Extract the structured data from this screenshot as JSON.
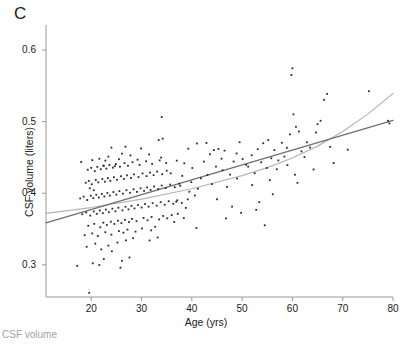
{
  "figure": {
    "panel_label": "C",
    "caption_sliver": "CSF volume"
  },
  "chart_data": {
    "type": "scatter",
    "title": "",
    "xlabel": "Age (yrs)",
    "ylabel": "CSF volume (liters)",
    "xlim": [
      11,
      80
    ],
    "ylim": [
      0.255,
      0.635
    ],
    "xticks": [
      20,
      30,
      40,
      50,
      60,
      70,
      80
    ],
    "xticklabels": [
      "20",
      "30",
      "40",
      "50",
      "60",
      "70",
      "80"
    ],
    "yticks": [
      0.3,
      0.4,
      0.5,
      0.6
    ],
    "yticklabels": [
      "0.3",
      "0.4",
      "0.5",
      "0.6"
    ],
    "grid": false,
    "legend": "none",
    "marker": {
      "shape": "square",
      "size_px": 1.8,
      "color": "#2b2b2b"
    },
    "series": [
      {
        "name": "CSF volume vs age",
        "points": [
          [
            17.2,
            0.2985
          ],
          [
            19.6,
            0.2608
          ],
          [
            20.3,
            0.3021
          ],
          [
            21.6,
            0.2997
          ],
          [
            22.5,
            0.3082
          ],
          [
            25.8,
            0.2959
          ],
          [
            26.1,
            0.3055
          ],
          [
            27.6,
            0.3102
          ],
          [
            24.1,
            0.3188
          ],
          [
            22.0,
            0.3215
          ],
          [
            19.1,
            0.3252
          ],
          [
            20.8,
            0.3295
          ],
          [
            23.4,
            0.3268
          ],
          [
            25.2,
            0.331
          ],
          [
            26.9,
            0.3341
          ],
          [
            28.3,
            0.3372
          ],
          [
            31.6,
            0.334
          ],
          [
            33.2,
            0.3382
          ],
          [
            18.7,
            0.3414
          ],
          [
            20.2,
            0.3438
          ],
          [
            21.3,
            0.3402
          ],
          [
            22.8,
            0.3455
          ],
          [
            24.0,
            0.3421
          ],
          [
            25.5,
            0.347
          ],
          [
            26.4,
            0.3449
          ],
          [
            27.2,
            0.3492
          ],
          [
            28.8,
            0.3463
          ],
          [
            30.1,
            0.3508
          ],
          [
            31.9,
            0.3481
          ],
          [
            32.7,
            0.3531
          ],
          [
            19.4,
            0.3545
          ],
          [
            20.6,
            0.3572
          ],
          [
            21.8,
            0.3524
          ],
          [
            22.4,
            0.3588
          ],
          [
            23.1,
            0.3556
          ],
          [
            23.9,
            0.3602
          ],
          [
            24.6,
            0.3571
          ],
          [
            25.3,
            0.3615
          ],
          [
            26.0,
            0.3583
          ],
          [
            26.7,
            0.3628
          ],
          [
            27.5,
            0.3598
          ],
          [
            28.1,
            0.3641
          ],
          [
            29.0,
            0.361
          ],
          [
            30.4,
            0.3655
          ],
          [
            31.2,
            0.3622
          ],
          [
            32.0,
            0.3668
          ],
          [
            33.5,
            0.3634
          ],
          [
            34.3,
            0.3682
          ],
          [
            35.1,
            0.3649
          ],
          [
            36.0,
            0.3695
          ],
          [
            18.2,
            0.3706
          ],
          [
            19.0,
            0.3732
          ],
          [
            19.8,
            0.3688
          ],
          [
            20.5,
            0.3745
          ],
          [
            21.1,
            0.3712
          ],
          [
            21.7,
            0.3758
          ],
          [
            22.3,
            0.3721
          ],
          [
            22.9,
            0.3771
          ],
          [
            23.5,
            0.3735
          ],
          [
            24.2,
            0.3784
          ],
          [
            24.8,
            0.3748
          ],
          [
            25.4,
            0.3797
          ],
          [
            26.2,
            0.3761
          ],
          [
            26.8,
            0.381
          ],
          [
            27.4,
            0.3774
          ],
          [
            28.0,
            0.3823
          ],
          [
            28.6,
            0.3787
          ],
          [
            29.3,
            0.3836
          ],
          [
            30.0,
            0.38
          ],
          [
            30.7,
            0.3849
          ],
          [
            31.4,
            0.3813
          ],
          [
            32.2,
            0.3862
          ],
          [
            33.0,
            0.3826
          ],
          [
            33.8,
            0.3875
          ],
          [
            34.6,
            0.3839
          ],
          [
            35.4,
            0.3888
          ],
          [
            36.3,
            0.3852
          ],
          [
            37.1,
            0.3901
          ],
          [
            38.0,
            0.3865
          ],
          [
            39.2,
            0.3914
          ],
          [
            17.8,
            0.3927
          ],
          [
            18.5,
            0.3952
          ],
          [
            19.2,
            0.3905
          ],
          [
            19.9,
            0.3965
          ],
          [
            20.4,
            0.3932
          ],
          [
            21.0,
            0.3978
          ],
          [
            21.5,
            0.3941
          ],
          [
            22.1,
            0.399
          ],
          [
            22.6,
            0.3954
          ],
          [
            23.2,
            0.4003
          ],
          [
            23.7,
            0.3967
          ],
          [
            24.4,
            0.4016
          ],
          [
            25.0,
            0.398
          ],
          [
            25.6,
            0.4029
          ],
          [
            26.3,
            0.3993
          ],
          [
            27.0,
            0.4042
          ],
          [
            27.7,
            0.4006
          ],
          [
            28.4,
            0.4055
          ],
          [
            29.1,
            0.4019
          ],
          [
            29.8,
            0.4068
          ],
          [
            30.5,
            0.4032
          ],
          [
            31.1,
            0.4081
          ],
          [
            31.8,
            0.4045
          ],
          [
            32.5,
            0.4094
          ],
          [
            33.3,
            0.4058
          ],
          [
            34.0,
            0.4107
          ],
          [
            34.8,
            0.4071
          ],
          [
            35.7,
            0.412
          ],
          [
            36.6,
            0.4084
          ],
          [
            37.5,
            0.4133
          ],
          [
            18.9,
            0.4146
          ],
          [
            19.5,
            0.4172
          ],
          [
            20.1,
            0.4125
          ],
          [
            20.9,
            0.4185
          ],
          [
            21.4,
            0.4152
          ],
          [
            22.2,
            0.4198
          ],
          [
            22.7,
            0.4161
          ],
          [
            23.3,
            0.4211
          ],
          [
            23.8,
            0.4174
          ],
          [
            24.5,
            0.4224
          ],
          [
            25.1,
            0.4187
          ],
          [
            25.9,
            0.4237
          ],
          [
            26.5,
            0.42
          ],
          [
            27.1,
            0.425
          ],
          [
            27.9,
            0.4213
          ],
          [
            28.5,
            0.4263
          ],
          [
            29.4,
            0.4226
          ],
          [
            30.2,
            0.4276
          ],
          [
            31.0,
            0.4239
          ],
          [
            31.7,
            0.4289
          ],
          [
            32.4,
            0.4252
          ],
          [
            33.1,
            0.4302
          ],
          [
            34.1,
            0.4265
          ],
          [
            35.0,
            0.4315
          ],
          [
            35.8,
            0.4278
          ],
          [
            19.3,
            0.4328
          ],
          [
            20.0,
            0.4355
          ],
          [
            20.7,
            0.4308
          ],
          [
            21.2,
            0.4368
          ],
          [
            21.9,
            0.4335
          ],
          [
            22.5,
            0.4381
          ],
          [
            23.0,
            0.4344
          ],
          [
            23.6,
            0.4394
          ],
          [
            24.3,
            0.4357
          ],
          [
            24.9,
            0.4407
          ],
          [
            25.7,
            0.437
          ],
          [
            26.6,
            0.442
          ],
          [
            27.3,
            0.4383
          ],
          [
            28.2,
            0.4433
          ],
          [
            29.6,
            0.4396
          ],
          [
            30.9,
            0.4446
          ],
          [
            32.1,
            0.4409
          ],
          [
            33.6,
            0.4459
          ],
          [
            34.9,
            0.4422
          ],
          [
            18.0,
            0.4435
          ],
          [
            21.6,
            0.4482
          ],
          [
            23.4,
            0.4512
          ],
          [
            25.5,
            0.4475
          ],
          [
            27.8,
            0.4528
          ],
          [
            29.2,
            0.4468
          ],
          [
            31.5,
            0.4541
          ],
          [
            33.9,
            0.4498
          ],
          [
            20.2,
            0.4462
          ],
          [
            22.8,
            0.4455
          ],
          [
            26.1,
            0.4553
          ],
          [
            24.0,
            0.4637
          ],
          [
            26.8,
            0.465
          ],
          [
            29.9,
            0.4625
          ],
          [
            33.4,
            0.4742
          ],
          [
            34.2,
            0.4762
          ],
          [
            34.0,
            0.5065
          ],
          [
            22.4,
            0.4386
          ],
          [
            24.7,
            0.4378
          ],
          [
            20.5,
            0.4042
          ],
          [
            19.7,
            0.4069
          ],
          [
            36.5,
            0.3598
          ],
          [
            37.2,
            0.3712
          ],
          [
            38.4,
            0.3652
          ],
          [
            36.9,
            0.3881
          ],
          [
            38.8,
            0.3795
          ],
          [
            37.7,
            0.4104
          ],
          [
            39.5,
            0.4021
          ],
          [
            38.1,
            0.4242
          ],
          [
            39.9,
            0.4155
          ],
          [
            37.0,
            0.4455
          ],
          [
            38.5,
            0.4418
          ],
          [
            39.3,
            0.4622
          ],
          [
            40.6,
            0.3968
          ],
          [
            41.2,
            0.4063
          ],
          [
            41.8,
            0.4208
          ],
          [
            40.1,
            0.4352
          ],
          [
            42.4,
            0.4442
          ],
          [
            41.0,
            0.4695
          ],
          [
            42.9,
            0.4702
          ],
          [
            43.6,
            0.4545
          ],
          [
            40.9,
            0.3515
          ],
          [
            43.1,
            0.4255
          ],
          [
            44.0,
            0.4128
          ],
          [
            44.8,
            0.4372
          ],
          [
            45.3,
            0.4618
          ],
          [
            45.9,
            0.4482
          ],
          [
            46.5,
            0.4595
          ],
          [
            44.4,
            0.4602
          ],
          [
            46.1,
            0.4321
          ],
          [
            47.0,
            0.4088
          ],
          [
            45.0,
            0.3915
          ],
          [
            46.8,
            0.3648
          ],
          [
            47.6,
            0.426
          ],
          [
            48.3,
            0.4442
          ],
          [
            48.9,
            0.4555
          ],
          [
            49.5,
            0.4712
          ],
          [
            50.1,
            0.4478
          ],
          [
            49.0,
            0.4205
          ],
          [
            50.8,
            0.4398
          ],
          [
            51.2,
            0.4372
          ],
          [
            48.0,
            0.3812
          ],
          [
            49.8,
            0.3725
          ],
          [
            51.9,
            0.453
          ],
          [
            52.5,
            0.4278
          ],
          [
            53.1,
            0.4615
          ],
          [
            53.8,
            0.4432
          ],
          [
            54.2,
            0.4698
          ],
          [
            52.0,
            0.4115
          ],
          [
            54.9,
            0.4352
          ],
          [
            53.4,
            0.3875
          ],
          [
            52.8,
            0.3768
          ],
          [
            54.5,
            0.3552
          ],
          [
            55.2,
            0.4742
          ],
          [
            55.8,
            0.4488
          ],
          [
            56.4,
            0.4602
          ],
          [
            56.9,
            0.4335
          ],
          [
            55.5,
            0.4182
          ],
          [
            57.2,
            0.4458
          ],
          [
            57.9,
            0.4705
          ],
          [
            56.1,
            0.3985
          ],
          [
            58.4,
            0.4512
          ],
          [
            58.9,
            0.4635
          ],
          [
            59.5,
            0.4822
          ],
          [
            59.0,
            0.4392
          ],
          [
            60.2,
            0.5102
          ],
          [
            60.7,
            0.4928
          ],
          [
            59.8,
            0.5652
          ],
          [
            60.0,
            0.5745
          ],
          [
            61.3,
            0.4862
          ],
          [
            61.8,
            0.4585
          ],
          [
            60.5,
            0.4258
          ],
          [
            62.4,
            0.4505
          ],
          [
            62.9,
            0.4712
          ],
          [
            61.0,
            0.4145
          ],
          [
            63.5,
            0.4638
          ],
          [
            64.2,
            0.4332
          ],
          [
            65.0,
            0.4965
          ],
          [
            65.6,
            0.5012
          ],
          [
            64.7,
            0.4848
          ],
          [
            66.3,
            0.5305
          ],
          [
            66.9,
            0.5388
          ],
          [
            67.5,
            0.4648
          ],
          [
            68.2,
            0.4422
          ],
          [
            71.0,
            0.4608
          ],
          [
            75.2,
            0.5425
          ],
          [
            79.0,
            0.5012
          ],
          [
            79.3,
            0.4975
          ]
        ]
      }
    ],
    "fits": [
      {
        "name": "quadratic-fit",
        "kind": "curve",
        "color": "#b5b5b5",
        "width_px": 1.2,
        "points": [
          [
            11,
            0.3718
          ],
          [
            20,
            0.38
          ],
          [
            30,
            0.3918
          ],
          [
            40,
            0.4062
          ],
          [
            50,
            0.4246
          ],
          [
            55,
            0.4358
          ],
          [
            60,
            0.4492
          ],
          [
            65,
            0.4658
          ],
          [
            70,
            0.4862
          ],
          [
            75,
            0.5105
          ],
          [
            80,
            0.5392
          ]
        ]
      },
      {
        "name": "linear-fit",
        "kind": "line",
        "color": "#6e6e6e",
        "width_px": 1.2,
        "points": [
          [
            11,
            0.3585
          ],
          [
            80,
            0.5018
          ]
        ]
      }
    ]
  }
}
